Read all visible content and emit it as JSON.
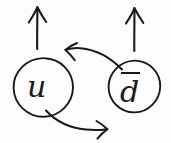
{
  "diagram": {
    "kind": "hand-drawn-particle-interaction-sketch",
    "background_color": "#fdfdfd",
    "ink_color": "#1a1a1a",
    "nodes": [
      {
        "id": "left-node",
        "name": "quark-u",
        "label": "u",
        "has_overbar": false,
        "shape": "circle",
        "cx": 43,
        "cy": 88,
        "r": 30
      },
      {
        "id": "right-node",
        "name": "antiquark-d",
        "label": "d",
        "has_overbar": true,
        "shape": "circle",
        "cx": 134,
        "cy": 87,
        "r": 26
      }
    ],
    "arrows": [
      {
        "id": "arrow-up-left",
        "name": "upward-arrow-left",
        "direction": "up",
        "from": [
          37,
          48
        ],
        "to": [
          37,
          7
        ]
      },
      {
        "id": "arrow-up-right",
        "name": "upward-arrow-right",
        "direction": "up",
        "from": [
          134,
          50
        ],
        "to": [
          134,
          8
        ]
      },
      {
        "id": "arrow-curve-upper",
        "name": "curved-arrow-right-to-left",
        "direction": "left",
        "from": [
          119,
          67
        ],
        "to": [
          66,
          50
        ]
      },
      {
        "id": "arrow-curve-lower",
        "name": "curved-arrow-left-to-right",
        "direction": "right",
        "from": [
          48,
          112
        ],
        "to": [
          107,
          129
        ]
      }
    ],
    "labels": {
      "u": "u",
      "d_bar": "d"
    }
  }
}
